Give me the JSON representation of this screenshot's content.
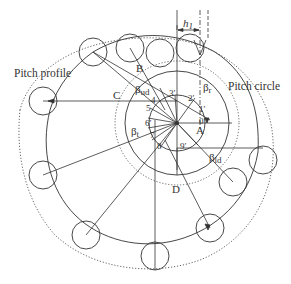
{
  "diagram": {
    "title": "",
    "labels": {
      "pitch_profile": "Pitch profile",
      "pitch_circle": "Pitch circle",
      "h_label": "h",
      "h_sub": "1",
      "point_A": "A",
      "point_B": "B",
      "point_C": "C",
      "point_D": "D",
      "beta_r": "β",
      "beta_r_sub": "r",
      "beta_ud": "β",
      "beta_ud_sub": "ud",
      "beta_t": "β",
      "beta_t_sub": "t",
      "beta_ld": "β",
      "beta_ld_sub": "ld"
    },
    "station_numbers": [
      "0′",
      "1′",
      "2′",
      "3′",
      "4",
      "5",
      "6′",
      "7",
      "8",
      "9′"
    ],
    "colors": {
      "stroke": "#333333",
      "dotted": "#555555",
      "background": "#ffffff"
    },
    "center": {
      "x": 177,
      "y": 123
    },
    "rollers": [
      {
        "x": 43,
        "y": 101
      },
      {
        "x": 93,
        "y": 52
      },
      {
        "x": 160,
        "y": 53
      },
      {
        "x": 258,
        "y": 152
      },
      {
        "x": 237,
        "y": 189
      },
      {
        "x": 210,
        "y": 229
      },
      {
        "x": 155,
        "y": 256
      },
      {
        "x": 86,
        "y": 233
      },
      {
        "x": 43,
        "y": 175
      }
    ]
  }
}
